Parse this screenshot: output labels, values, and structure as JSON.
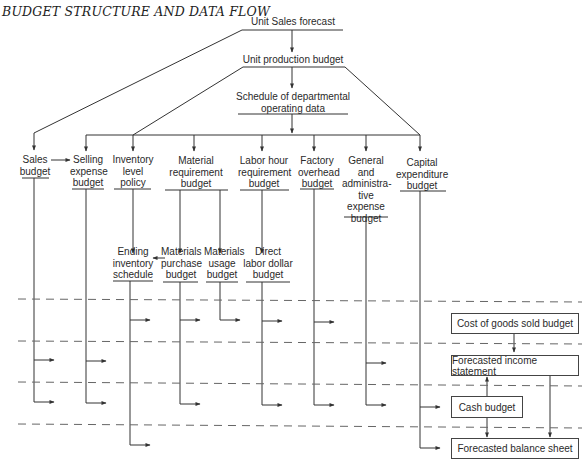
{
  "title": "BUDGET STRUCTURE AND DATA FLOW",
  "nodes": {
    "unit_sales_forecast": "Unit Sales forecast",
    "unit_production_budget": "Unit production budget",
    "schedule_departmental": "Schedule of departmental\noperating data",
    "sales_budget": "Sales\nbudget",
    "selling_expense_budget": "Selling\nexpense\nbudget",
    "inventory_level_policy": "Inventory\nlevel\npolicy",
    "material_requirement_budget": "Material\nrequirement\nbudget",
    "labor_hour_requirement_budget": "Labor hour\nrequirement\nbudget",
    "factory_overhead_budget": "Factory\noverhead\nbudget",
    "general_admin_expense_budget": "General\nand\nadministra-\ntive\nexpense\nbudget",
    "capital_expenditure_budget": "Capital\nexpenditure\nbudget",
    "ending_inventory_schedule": "Ending\ninventory\nschedule",
    "materials_purchase_budget": "Materials\npurchase\nbudget",
    "materials_usage_budget": "Materials\nusage\nbudget",
    "direct_labor_dollar_budget": "Direct\nlabor dollar\nbudget"
  },
  "statements": {
    "cost_of_goods_sold_budget": "Cost of goods sold budget",
    "forecasted_income_statement": "Forecasted income statement",
    "cash_budget": "Cash budget",
    "forecasted_balance_sheet": "Forecasted balance sheet"
  },
  "colors": {
    "line": "#333333",
    "dash": "#666666",
    "text": "#2a2a2a",
    "background": "#ffffff"
  }
}
